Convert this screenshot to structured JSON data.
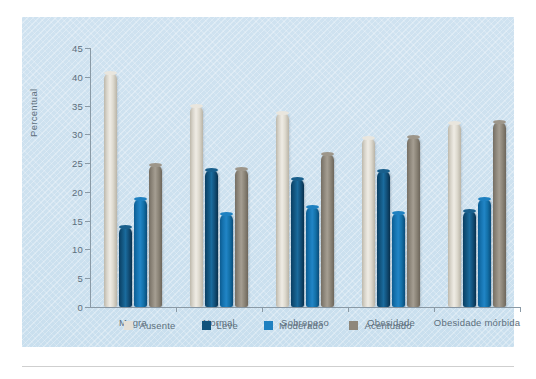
{
  "chart_data": {
    "type": "bar",
    "title": "",
    "xlabel": "",
    "ylabel": "Percentual",
    "ylim": [
      0,
      45
    ],
    "yticks": [
      0,
      5,
      10,
      15,
      20,
      25,
      30,
      35,
      40,
      45
    ],
    "grid": false,
    "legend_position": "bottom",
    "categories": [
      "Magra",
      "Normal",
      "Sobrepeso",
      "Obesidade",
      "Obesidade mórbida"
    ],
    "series": [
      {
        "name": "Ausente",
        "color": "#e4e0d7",
        "values": [
          40.6,
          35.0,
          33.7,
          29.4,
          31.9
        ]
      },
      {
        "name": "Leve",
        "color": "#11537c",
        "values": [
          13.9,
          23.8,
          22.2,
          23.7,
          16.7
        ]
      },
      {
        "name": "Moderado",
        "color": "#1e80c0",
        "values": [
          18.7,
          16.2,
          17.3,
          16.4,
          18.7
        ]
      },
      {
        "name": "Acentuado",
        "color": "#8e877b",
        "values": [
          24.6,
          23.9,
          26.6,
          29.6,
          32.1
        ]
      }
    ]
  },
  "panel": {
    "background_color": "#cde1ef"
  }
}
